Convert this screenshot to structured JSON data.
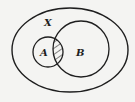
{
  "diagram": {
    "type": "venn",
    "universe_label": "X",
    "sets": [
      {
        "name": "A",
        "label": "A"
      },
      {
        "name": "B",
        "label": "B"
      }
    ],
    "shaded_region": "A ∩ B",
    "colors": {
      "background": "#f4f4f2",
      "stroke": "#1e1e1e",
      "hatch": "#1e1e1e"
    }
  }
}
